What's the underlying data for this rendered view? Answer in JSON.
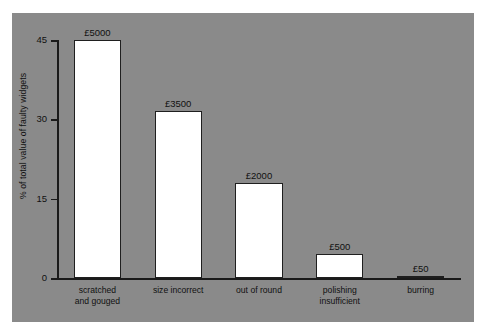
{
  "chart_data": {
    "type": "bar",
    "title": "",
    "subtitle": "",
    "xlabel": "",
    "ylabel": "% of total value of faulty widgets",
    "ylim": [
      0,
      45
    ],
    "yticks": [
      "0",
      "15",
      "30",
      "45"
    ],
    "ytick_values": [
      0,
      15,
      30,
      45
    ],
    "grid": false,
    "legend": false,
    "categories": [
      "scratched\nand gouged",
      "size incorrect",
      "out of round",
      "polishing\ninsufficient",
      "burring"
    ],
    "values": [
      45.0,
      31.5,
      18.0,
      4.5,
      0.45
    ],
    "data_labels": [
      "£5000",
      "£3500",
      "£2000",
      "£500",
      "£50"
    ],
    "data_label_amounts": [
      5000,
      3500,
      2000,
      500,
      50
    ],
    "currency": "£",
    "series": [
      {
        "name": "% of total value of faulty widgets",
        "values": [
          45.0,
          31.5,
          18.0,
          4.5,
          0.45
        ]
      }
    ],
    "colors": {
      "panel_background": "#8a8a8a",
      "page_background": "#ffffff",
      "bar_fill": "#ffffff",
      "bar_stroke": "#1f1f1f",
      "axis": "#1a1a1a",
      "text": "#111111"
    }
  },
  "axis": {
    "y_title": "% of total value of faulty widgets",
    "ticks": [
      {
        "label": "45",
        "value": 45
      },
      {
        "label": "30",
        "value": 30
      },
      {
        "label": "15",
        "value": 15
      },
      {
        "label": "0",
        "value": 0
      }
    ]
  },
  "bars": [
    {
      "category": "scratched\nand gouged",
      "value": 45.0,
      "label": "£5000"
    },
    {
      "category": "size incorrect",
      "value": 31.5,
      "label": "£3500"
    },
    {
      "category": "out of round",
      "value": 18.0,
      "label": "£2000"
    },
    {
      "category": "polishing\ninsufficient",
      "value": 4.5,
      "label": "£500"
    },
    {
      "category": "burring",
      "value": 0.45,
      "label": "£50"
    }
  ]
}
